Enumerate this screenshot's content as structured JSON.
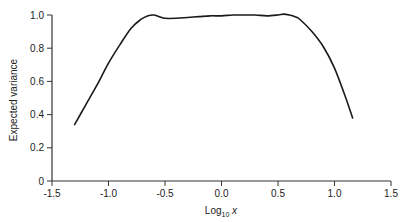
{
  "chart_data": {
    "type": "line",
    "title": "",
    "xlabel": "Log10 x",
    "xlabel_main": "Log",
    "xlabel_sub": "10",
    "xlabel_tail": " x",
    "ylabel": "Expected variance",
    "xlim": [
      -1.5,
      1.5
    ],
    "ylim": [
      0,
      1.0
    ],
    "grid": false,
    "legend": null,
    "x_ticks": [
      -1.5,
      -1.0,
      -0.5,
      0.0,
      0.5,
      1.0,
      1.5
    ],
    "x_tick_labels": [
      "-1.5",
      "-1.0",
      "-0.5",
      "0.0",
      "0.5",
      "1.0",
      "1.5"
    ],
    "y_ticks": [
      0,
      0.2,
      0.4,
      0.6,
      0.8,
      1.0
    ],
    "y_tick_labels": [
      "0",
      "0.2",
      "0.4",
      "0.6",
      "0.8",
      "1.0"
    ],
    "series": [
      {
        "name": "Expected variance",
        "color": "#1a1a1a",
        "x": [
          -1.3,
          -1.2,
          -1.1,
          -1.0,
          -0.9,
          -0.8,
          -0.72,
          -0.65,
          -0.6,
          -0.55,
          -0.5,
          -0.4,
          -0.3,
          -0.2,
          -0.1,
          0.0,
          0.1,
          0.2,
          0.3,
          0.4,
          0.5,
          0.55,
          0.6,
          0.65,
          0.7,
          0.8,
          0.9,
          1.0,
          1.1,
          1.16
        ],
        "values": [
          0.34,
          0.46,
          0.58,
          0.71,
          0.82,
          0.92,
          0.97,
          0.995,
          1.0,
          0.99,
          0.98,
          0.98,
          0.985,
          0.99,
          0.995,
          0.995,
          1.0,
          1.0,
          1.0,
          0.995,
          1.0,
          1.005,
          1.0,
          0.99,
          0.97,
          0.9,
          0.81,
          0.68,
          0.5,
          0.38
        ]
      }
    ]
  }
}
